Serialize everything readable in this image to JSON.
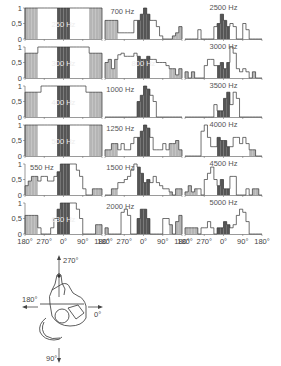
{
  "chart_data": {
    "type": "bar",
    "title": "",
    "xlabel": "azimuth",
    "ylabel": "normalized response",
    "x_ticks": [
      "180°",
      "270°",
      "0°",
      "90°",
      "180°"
    ],
    "y_ticks": [
      "0",
      "0,5",
      "1"
    ],
    "ylim": [
      0,
      1
    ],
    "bins": 24,
    "region_colors": {
      "side": "#b5b5b5",
      "front": "#555555",
      "outline": "#ffffff"
    },
    "panels": [
      {
        "label": "250 Hz",
        "col": 0,
        "row": 0,
        "label_inside": true,
        "values": [
          1,
          1,
          1,
          1,
          1,
          1,
          1,
          1,
          1,
          1,
          1,
          1,
          1,
          1,
          1,
          1,
          1,
          1,
          1,
          1,
          1,
          1,
          1,
          1
        ]
      },
      {
        "label": "300 Hz",
        "col": 0,
        "row": 1,
        "label_inside": true,
        "values": [
          0.8,
          0.8,
          0.8,
          0.8,
          1,
          1,
          1,
          1,
          1,
          1,
          1,
          1,
          1,
          1,
          1,
          1,
          1,
          1,
          1,
          1,
          0.8,
          0.8,
          0.8,
          0.8
        ]
      },
      {
        "label": "400 Hz",
        "col": 0,
        "row": 2,
        "label_inside": true,
        "values": [
          0.8,
          0.8,
          0.8,
          0.8,
          0.8,
          1,
          1,
          1,
          1,
          1,
          1,
          1,
          1,
          1,
          1,
          1,
          1,
          1,
          1,
          0.8,
          0.8,
          0.8,
          0.8,
          0.8
        ]
      },
      {
        "label": "500 Hz",
        "col": 0,
        "row": 3,
        "label_inside": true,
        "values": [
          1,
          1,
          1,
          1,
          1,
          1,
          1,
          1,
          1,
          1,
          1,
          1,
          1,
          1,
          1,
          1,
          1,
          1,
          1,
          1,
          1,
          1,
          1,
          1
        ]
      },
      {
        "label": "550 Hz",
        "col": 0,
        "row": 4,
        "label_inside": false,
        "values": [
          0.3,
          0.45,
          0.6,
          0.6,
          0.45,
          0.6,
          0.6,
          0.45,
          0.45,
          0.6,
          0.75,
          1,
          1,
          1,
          1,
          1,
          0.8,
          0.6,
          0.2,
          0,
          0,
          0.2,
          0.2,
          0.2
        ]
      },
      {
        "label": "630 Hz",
        "col": 0,
        "row": 5,
        "label_inside": true,
        "values": [
          0.6,
          0.6,
          0.6,
          0.6,
          0.2,
          0,
          0,
          0,
          0.2,
          0.5,
          0.8,
          1,
          1,
          1,
          1,
          1,
          0.8,
          0.5,
          0,
          0,
          0,
          0,
          0.3,
          0.3
        ]
      },
      {
        "label": "700 Hz",
        "col": 1,
        "row": 0,
        "label_inside": false,
        "values": [
          0.6,
          0.6,
          0.6,
          0.6,
          0.2,
          0.2,
          0.2,
          0.2,
          0.2,
          0.6,
          0.6,
          0.8,
          1,
          0.8,
          0.6,
          0.6,
          0.4,
          0.1,
          0,
          0,
          0,
          0.1,
          0.2,
          0.4
        ]
      },
      {
        "label": "800 Hz",
        "col": 1,
        "row": 1,
        "label_inside": true,
        "values": [
          0.5,
          0.6,
          0.3,
          0.6,
          0.75,
          0.8,
          0.7,
          0.7,
          0.7,
          0.8,
          0.7,
          0.6,
          0.6,
          0.7,
          0.6,
          0.6,
          0.5,
          0.5,
          0.5,
          0.4,
          0.3,
          0.3,
          0.1,
          0.3
        ]
      },
      {
        "label": "1000 Hz",
        "col": 1,
        "row": 2,
        "label_inside": false,
        "values": [
          0,
          0,
          0,
          0,
          0,
          0,
          0,
          0,
          0,
          0,
          0.5,
          0.7,
          1,
          0.9,
          0.7,
          0.5,
          0,
          0,
          0,
          0,
          0,
          0,
          0,
          0
        ]
      },
      {
        "label": "1250 Hz",
        "col": 1,
        "row": 3,
        "label_inside": false,
        "values": [
          0.2,
          0.2,
          0.4,
          0.4,
          0.2,
          0.4,
          0.2,
          0.2,
          0.4,
          0.6,
          0.6,
          0.8,
          1,
          0.9,
          0.6,
          0.2,
          0.2,
          0.2,
          0.4,
          0.2,
          0.4,
          0.4,
          0.5,
          0.2
        ]
      },
      {
        "label": "1500 Hz",
        "col": 1,
        "row": 4,
        "label_inside": false,
        "values": [
          0,
          0,
          0.2,
          0.2,
          0.4,
          0.4,
          0.5,
          0.6,
          0.8,
          1,
          0.9,
          0.7,
          0.4,
          0.5,
          0.4,
          0.6,
          0.4,
          0.3,
          0.2,
          0.2,
          0.1,
          0,
          0.2,
          0.2
        ]
      },
      {
        "label": "2000 Hz",
        "col": 1,
        "row": 5,
        "label_inside": false,
        "values": [
          0.2,
          0,
          0,
          0,
          0,
          0.7,
          0.8,
          0.6,
          0,
          0,
          0.5,
          0.8,
          0.8,
          0.5,
          0,
          0,
          0,
          0,
          0.5,
          0.5,
          0.3,
          0,
          0.4,
          0.6
        ]
      },
      {
        "label": "2500 Hz",
        "col": 2,
        "row": 0,
        "label_inside": false,
        "values": [
          0,
          0,
          0,
          0,
          0.3,
          0,
          0,
          0,
          0,
          0.4,
          0.5,
          0.8,
          0.6,
          0.4,
          0.5,
          0.4,
          0,
          0,
          0.5,
          0.3,
          0,
          0,
          0,
          0
        ]
      },
      {
        "label": "3000 Hz",
        "col": 2,
        "row": 1,
        "label_inside": false,
        "values": [
          0.2,
          0,
          0.2,
          0,
          0,
          0,
          0.4,
          0.6,
          0.6,
          0.4,
          0.4,
          0.5,
          0.3,
          0.5,
          1,
          0.8,
          0.3,
          0.2,
          0.3,
          0.2,
          0,
          0.2,
          0,
          0
        ]
      },
      {
        "label": "3500 Hz",
        "col": 2,
        "row": 2,
        "label_inside": false,
        "values": [
          0,
          0,
          0,
          0,
          0,
          0,
          0,
          0,
          0,
          0.4,
          0.2,
          0.2,
          0.6,
          0.8,
          0.4,
          0.8,
          0.6,
          0,
          0,
          0,
          0,
          0,
          0,
          0
        ]
      },
      {
        "label": "4000 Hz",
        "col": 2,
        "row": 3,
        "label_inside": false,
        "values": [
          0,
          0,
          0,
          0,
          0,
          0.8,
          1,
          0.6,
          0.3,
          0.3,
          0.6,
          0.5,
          0.5,
          0.3,
          0.3,
          0.6,
          0.6,
          0.4,
          0.6,
          0.4,
          0.2,
          0.2,
          0,
          0
        ]
      },
      {
        "label": "4500 Hz",
        "col": 2,
        "row": 4,
        "label_inside": false,
        "values": [
          0.1,
          0.3,
          0.1,
          0.2,
          0.2,
          0,
          0.5,
          0.7,
          0.9,
          0.5,
          0.3,
          0.5,
          0.2,
          0.2,
          0.6,
          0.6,
          0,
          0,
          0,
          0.2,
          0,
          0.2,
          0.2,
          0
        ]
      },
      {
        "label": "5000 Hz",
        "col": 2,
        "row": 5,
        "label_inside": false,
        "values": [
          0.2,
          0.2,
          0.2,
          0.2,
          0,
          0.2,
          0.2,
          0.4,
          0.2,
          0,
          0.2,
          0.2,
          0.4,
          0.3,
          0.2,
          0.3,
          0.6,
          0.8,
          0.7,
          0.4,
          0,
          0,
          0,
          0
        ]
      }
    ]
  },
  "diagram": {
    "labels": {
      "up": "270°",
      "left": "180°",
      "right": "0°",
      "down": "90°"
    }
  }
}
